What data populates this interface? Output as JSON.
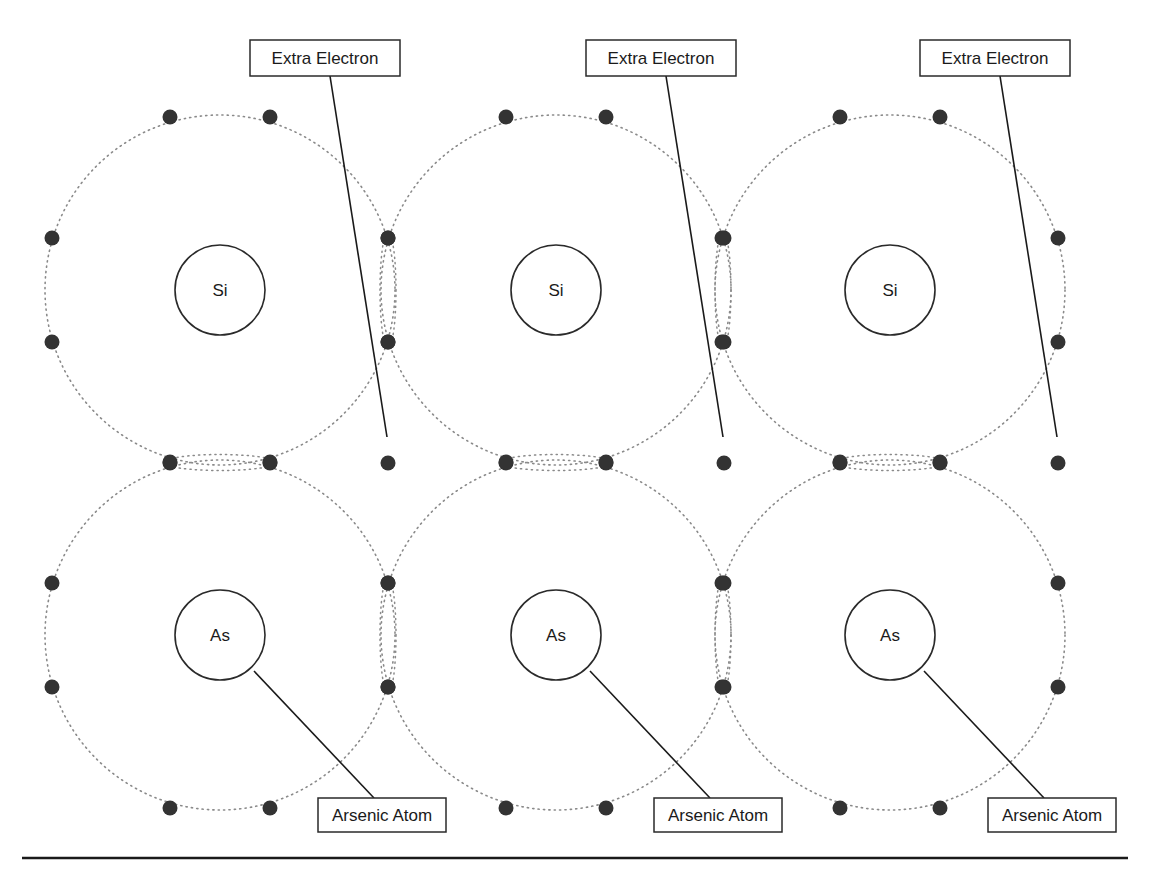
{
  "figure": {
    "type": "n-type semiconductor lattice (arsenic-doped silicon)",
    "rows": [
      {
        "row": "top",
        "atoms": [
          {
            "symbol": "Si",
            "valence_electrons": 8,
            "extra_electron": true
          },
          {
            "symbol": "Si",
            "valence_electrons": 8,
            "extra_electron": true
          },
          {
            "symbol": "Si",
            "valence_electrons": 8,
            "extra_electron": true
          }
        ]
      },
      {
        "row": "bottom",
        "atoms": [
          {
            "symbol": "As",
            "valence_electrons": 8,
            "labelled": true
          },
          {
            "symbol": "As",
            "valence_electrons": 8,
            "labelled": true
          },
          {
            "symbol": "As",
            "valence_electrons": 8,
            "labelled": true
          }
        ]
      }
    ],
    "labels": {
      "extra_electron": "Extra Electron",
      "arsenic_atom": "Arsenic Atom"
    },
    "colors": {
      "electron": "#333333",
      "orbit": "#8a8a8a",
      "outline": "#2a2a2a"
    }
  }
}
